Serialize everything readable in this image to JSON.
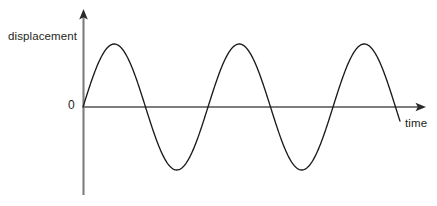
{
  "figure": {
    "background_color": "#ffffff",
    "width": 437,
    "height": 206
  },
  "labels": {
    "y_axis": "displacement",
    "x_axis": "time",
    "origin": "0"
  },
  "axes": {
    "color": "#7d7d7d",
    "origin_x": 83,
    "origin_y": 107,
    "y_axis_top": 10,
    "y_axis_bottom": 195,
    "x_axis_right": 425,
    "arrowheads": [
      "y-axis-arrow-up",
      "x-axis-arrow-right"
    ]
  },
  "chart_data": {
    "type": "line",
    "title": "",
    "xlabel": "time",
    "ylabel": "displacement",
    "grid": false,
    "legend": null,
    "curve_color": "#1a1a1a",
    "waveform": "sine",
    "amplitude": 63,
    "period_px": 125,
    "cycles": 2.54,
    "phase": 0,
    "x_start_px": 83,
    "x_end_px": 400,
    "baseline_y_px": 107,
    "peak_y_px": 44,
    "trough_y_px": 169,
    "peaks_x_px": [
      114,
      239,
      364
    ],
    "troughs_x_px": [
      176,
      301
    ],
    "zero_crossings_x_px": [
      83,
      145,
      207,
      270,
      332,
      395
    ],
    "x": [
      0,
      0.125,
      0.25,
      0.375,
      0.5,
      0.625,
      0.75,
      0.875,
      1.0,
      1.125,
      1.25,
      1.375,
      1.5,
      1.625,
      1.75,
      1.875,
      2.0,
      2.125,
      2.25,
      2.375,
      2.5,
      2.54
    ],
    "values": [
      0,
      0.707,
      1.0,
      0.707,
      0,
      -0.707,
      -1.0,
      -0.707,
      0,
      0.707,
      1.0,
      0.707,
      0,
      -0.707,
      -1.0,
      -0.707,
      0,
      0.707,
      1.0,
      0.707,
      0,
      -0.25
    ],
    "ylim": [
      -1.15,
      1.15
    ],
    "xlim": [
      0,
      2.73
    ],
    "tick_labels": {
      "y": [
        "0"
      ],
      "x": []
    }
  }
}
